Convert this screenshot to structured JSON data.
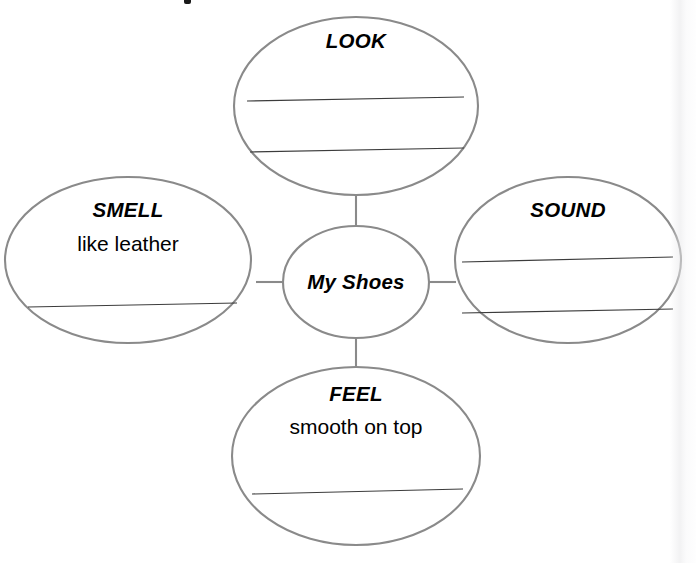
{
  "worksheet": {
    "type": "five-senses-bubble-map",
    "center": {
      "label": "My Shoes"
    },
    "bubbles": [
      {
        "id": "look",
        "title": "LOOK",
        "answer": "",
        "blank_lines": 2
      },
      {
        "id": "smell",
        "title": "SMELL",
        "answer": "like leather",
        "blank_lines": 1
      },
      {
        "id": "sound",
        "title": "SOUND",
        "answer": "",
        "blank_lines": 2
      },
      {
        "id": "feel",
        "title": "FEEL",
        "answer": "smooth on top",
        "blank_lines": 1
      }
    ],
    "colors": {
      "bubble_stroke": "#8a8a8a",
      "write_line": "#3c3c3c",
      "text": "#000000",
      "background": "#ffffff"
    }
  }
}
